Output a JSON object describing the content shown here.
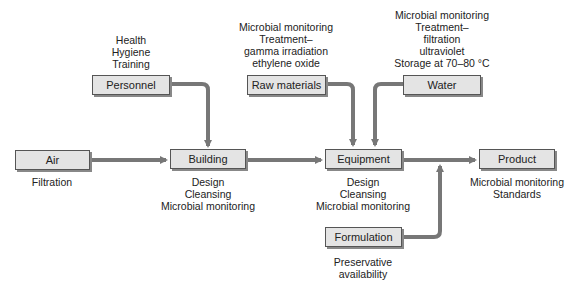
{
  "nodes": {
    "personnel": {
      "label": "Personnel",
      "notes": [
        "Health",
        "Hygiene",
        "Training"
      ]
    },
    "raw_materials": {
      "label": "Raw materials",
      "notes": [
        "Microbial monitoring",
        "Treatment–",
        "gamma irradiation",
        "ethylene oxide"
      ]
    },
    "water": {
      "label": "Water",
      "notes": [
        "Microbial monitoring",
        "Treatment–",
        "filtration",
        "ultraviolet",
        "Storage at 70–80 °C"
      ]
    },
    "air": {
      "label": "Air",
      "notes": [
        "Filtration"
      ]
    },
    "building": {
      "label": "Building",
      "notes": [
        "Design",
        "Cleansing",
        "Microbial monitoring"
      ]
    },
    "equipment": {
      "label": "Equipment",
      "notes": [
        "Design",
        "Cleansing",
        "Microbial monitoring"
      ]
    },
    "product": {
      "label": "Product",
      "notes": [
        "Microbial monitoring",
        "Standards"
      ]
    },
    "formulation": {
      "label": "Formulation",
      "notes": [
        "Preservative",
        "availability"
      ]
    }
  },
  "edges": [
    [
      "Personnel",
      "Building"
    ],
    [
      "Air",
      "Building"
    ],
    [
      "Building",
      "Equipment"
    ],
    [
      "Raw materials",
      "Equipment"
    ],
    [
      "Water",
      "Equipment"
    ],
    [
      "Equipment",
      "Product"
    ],
    [
      "Formulation",
      "Product"
    ]
  ],
  "colors": {
    "box_fill": "#e4e4e4",
    "box_border": "#555555",
    "arrow": "#777777"
  }
}
